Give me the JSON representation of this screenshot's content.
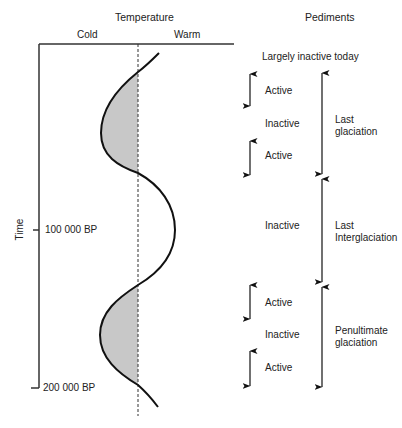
{
  "headers": {
    "temperature": "Temperature",
    "pediments": "Pediments",
    "cold": "Cold",
    "warm": "Warm"
  },
  "axis": {
    "time_label": "Time",
    "ticks": [
      {
        "label": "100 000 BP"
      },
      {
        "label": "200 000 BP"
      }
    ]
  },
  "pediment_states": {
    "top": "Largely inactive today",
    "items": [
      {
        "label": "Active"
      },
      {
        "label": "Inactive"
      },
      {
        "label": "Active"
      },
      {
        "label": "Inactive"
      },
      {
        "label": "Active"
      },
      {
        "label": "Inactive"
      },
      {
        "label": "Active"
      }
    ]
  },
  "periods": [
    {
      "line1": "Last",
      "line2": "glaciation"
    },
    {
      "line1": "Last",
      "line2": "Interglaciation"
    },
    {
      "line1": "Penultimate",
      "line2": "glaciation"
    }
  ],
  "colors": {
    "line": "#111111",
    "axis": "#333333",
    "shade": "#c8c8c8"
  }
}
